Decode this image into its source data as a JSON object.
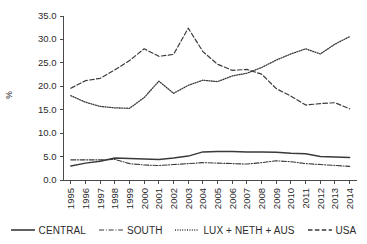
{
  "chart_data": {
    "type": "line",
    "title": "",
    "subtitle": "",
    "xlabel": "",
    "ylabel": "%",
    "grid": false,
    "legend_position": "bottom",
    "ylim": [
      0,
      35
    ],
    "ytick_labels": [
      "0.0",
      "5.0",
      "10.0",
      "15.0",
      "20.0",
      "25.0",
      "30.0",
      "35.0"
    ],
    "ytick_values": [
      0,
      5,
      10,
      15,
      20,
      25,
      30,
      35
    ],
    "categories": [
      "1995",
      "1996",
      "1997",
      "1998",
      "1999",
      "2000",
      "2001",
      "2002",
      "2003",
      "2004",
      "2005",
      "2006",
      "2007",
      "2008",
      "2009",
      "2010",
      "2011",
      "2012",
      "2013",
      "2014"
    ],
    "x": [
      1995,
      1996,
      1997,
      1998,
      1999,
      2000,
      2001,
      2002,
      2003,
      2004,
      2005,
      2006,
      2007,
      2008,
      2009,
      2010,
      2011,
      2012,
      2013,
      2014
    ],
    "series": [
      {
        "name": "CENTRAL",
        "style": "solid",
        "values": [
          3.0,
          3.6,
          4.0,
          4.7,
          4.6,
          4.5,
          4.4,
          4.7,
          5.1,
          6.0,
          6.1,
          6.1,
          6.0,
          6.0,
          5.9,
          5.7,
          5.6,
          5.0,
          4.9,
          4.8
        ]
      },
      {
        "name": "SOUTH",
        "style": "dash-dot",
        "values": [
          4.3,
          4.3,
          4.3,
          4.4,
          3.5,
          3.2,
          3.1,
          3.3,
          3.5,
          3.7,
          3.6,
          3.5,
          3.4,
          3.7,
          4.1,
          3.9,
          3.5,
          3.3,
          3.1,
          2.9
        ]
      },
      {
        "name": "LUX + NETH + AUS",
        "style": "dotted",
        "values": [
          18.0,
          16.6,
          15.7,
          15.4,
          15.3,
          17.6,
          21.1,
          18.5,
          20.2,
          21.3,
          21.0,
          22.2,
          20.5,
          22.6,
          24.4,
          26.0,
          28.0,
          26.9,
          28.6,
          30.6
        ]
      },
      {
        "name": "USA",
        "style": "dashed",
        "values": [
          19.6,
          21.2,
          21.7,
          23.5,
          25.5,
          28.0,
          26.4,
          26.8,
          32.4,
          27.4,
          24.7,
          23.4,
          23.6,
          23.8,
          22.6,
          19.5,
          17.5,
          16.7,
          16.0,
          16.6
        ]
      }
    ],
    "series_render": {
      "CENTRAL": [
        3.0,
        3.6,
        4.0,
        4.7,
        4.6,
        4.5,
        4.4,
        4.7,
        5.1,
        6.0,
        6.1,
        6.1,
        6.0,
        6.0,
        5.9,
        5.7,
        5.6,
        5.0,
        4.9,
        4.8
      ],
      "SOUTH": [
        4.3,
        4.3,
        4.3,
        4.4,
        3.5,
        3.2,
        3.1,
        3.3,
        3.5,
        3.7,
        3.6,
        3.5,
        3.4,
        3.7,
        4.1,
        3.9,
        3.5,
        3.3,
        3.1,
        2.9
      ],
      "LUX + NETH + AUS": [
        18.0,
        16.6,
        15.7,
        15.4,
        15.3,
        17.6,
        21.1,
        18.5,
        20.2,
        21.3,
        21.0,
        22.2,
        22.8,
        24.0,
        25.6,
        26.9,
        28.0,
        26.9,
        29.0,
        30.6
      ],
      "USA": [
        19.6,
        21.2,
        21.7,
        23.5,
        25.5,
        28.0,
        26.4,
        26.8,
        32.4,
        27.4,
        24.7,
        23.4,
        23.6,
        22.6,
        19.5,
        17.9,
        16.0,
        16.3,
        16.5,
        15.2
      ]
    }
  },
  "legend": {
    "items": [
      {
        "label": "CENTRAL",
        "style": "solid"
      },
      {
        "label": "SOUTH",
        "style": "dash-dot"
      },
      {
        "label": "LUX + NETH + AUS",
        "style": "dotted"
      },
      {
        "label": "USA",
        "style": "dashed"
      }
    ]
  }
}
